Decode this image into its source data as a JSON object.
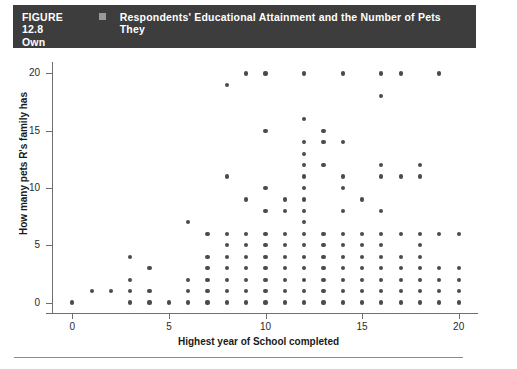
{
  "caption": {
    "figure_number": "FIGURE 12.8",
    "marker_icon": "filled-square-icon",
    "title_line1": "Respondents' Educational Attainment and the Number of Pets They",
    "title_line2": "Own",
    "bar_color": "#3d3d3d",
    "text_color": "#ffffff"
  },
  "chart_data": {
    "type": "scatter",
    "title": "Respondents' Educational Attainment and the Number of Pets They Own",
    "xlabel": "Highest year of School completed",
    "ylabel": "How many pets R's family has",
    "xlim": [
      -1,
      21
    ],
    "ylim": [
      -1,
      21
    ],
    "xticks": [
      0,
      5,
      10,
      15,
      20
    ],
    "yticks": [
      0,
      5,
      10,
      15,
      20
    ],
    "xtick_labels": [
      "0",
      "5",
      "10",
      "15",
      "20"
    ],
    "ytick_labels": [
      "0",
      "5",
      "10",
      "15",
      "20"
    ],
    "grid": false,
    "legend": false,
    "marker_color": "#4a4a52",
    "marker_size": 4,
    "points": [
      [
        0,
        0
      ],
      [
        1,
        1
      ],
      [
        2,
        1
      ],
      [
        3,
        0
      ],
      [
        3,
        1
      ],
      [
        3,
        2
      ],
      [
        3,
        4
      ],
      [
        4,
        0
      ],
      [
        4,
        1
      ],
      [
        4,
        3
      ],
      [
        5,
        0
      ],
      [
        6,
        0
      ],
      [
        6,
        1
      ],
      [
        6,
        2
      ],
      [
        6,
        7
      ],
      [
        7,
        0
      ],
      [
        7,
        1
      ],
      [
        7,
        2
      ],
      [
        7,
        3
      ],
      [
        7,
        4
      ],
      [
        7,
        6
      ],
      [
        8,
        0
      ],
      [
        8,
        1
      ],
      [
        8,
        2
      ],
      [
        8,
        3
      ],
      [
        8,
        4
      ],
      [
        8,
        5
      ],
      [
        8,
        6
      ],
      [
        8,
        11
      ],
      [
        8,
        19
      ],
      [
        9,
        0
      ],
      [
        9,
        1
      ],
      [
        9,
        2
      ],
      [
        9,
        3
      ],
      [
        9,
        4
      ],
      [
        9,
        5
      ],
      [
        9,
        6
      ],
      [
        9,
        9
      ],
      [
        9,
        20
      ],
      [
        10,
        0
      ],
      [
        10,
        1
      ],
      [
        10,
        2
      ],
      [
        10,
        3
      ],
      [
        10,
        4
      ],
      [
        10,
        5
      ],
      [
        10,
        6
      ],
      [
        10,
        8
      ],
      [
        10,
        10
      ],
      [
        10,
        15
      ],
      [
        10,
        20
      ],
      [
        11,
        0
      ],
      [
        11,
        1
      ],
      [
        11,
        2
      ],
      [
        11,
        3
      ],
      [
        11,
        4
      ],
      [
        11,
        5
      ],
      [
        11,
        6
      ],
      [
        11,
        8
      ],
      [
        11,
        9
      ],
      [
        12,
        0
      ],
      [
        12,
        1
      ],
      [
        12,
        2
      ],
      [
        12,
        3
      ],
      [
        12,
        4
      ],
      [
        12,
        5
      ],
      [
        12,
        6
      ],
      [
        12,
        7
      ],
      [
        12,
        8
      ],
      [
        12,
        9
      ],
      [
        12,
        10
      ],
      [
        12,
        11
      ],
      [
        12,
        12
      ],
      [
        12,
        13
      ],
      [
        12,
        14
      ],
      [
        12,
        16
      ],
      [
        12,
        20
      ],
      [
        13,
        0
      ],
      [
        13,
        1
      ],
      [
        13,
        2
      ],
      [
        13,
        3
      ],
      [
        13,
        4
      ],
      [
        13,
        5
      ],
      [
        13,
        6
      ],
      [
        13,
        12
      ],
      [
        13,
        14
      ],
      [
        13,
        15
      ],
      [
        14,
        0
      ],
      [
        14,
        1
      ],
      [
        14,
        2
      ],
      [
        14,
        3
      ],
      [
        14,
        4
      ],
      [
        14,
        5
      ],
      [
        14,
        6
      ],
      [
        14,
        8
      ],
      [
        14,
        10
      ],
      [
        14,
        11
      ],
      [
        14,
        14
      ],
      [
        14,
        20
      ],
      [
        15,
        0
      ],
      [
        15,
        1
      ],
      [
        15,
        2
      ],
      [
        15,
        3
      ],
      [
        15,
        4
      ],
      [
        15,
        5
      ],
      [
        15,
        6
      ],
      [
        15,
        9
      ],
      [
        16,
        0
      ],
      [
        16,
        1
      ],
      [
        16,
        2
      ],
      [
        16,
        3
      ],
      [
        16,
        4
      ],
      [
        16,
        5
      ],
      [
        16,
        6
      ],
      [
        16,
        8
      ],
      [
        16,
        11
      ],
      [
        16,
        12
      ],
      [
        16,
        18
      ],
      [
        16,
        20
      ],
      [
        17,
        0
      ],
      [
        17,
        1
      ],
      [
        17,
        2
      ],
      [
        17,
        3
      ],
      [
        17,
        4
      ],
      [
        17,
        6
      ],
      [
        17,
        11
      ],
      [
        17,
        20
      ],
      [
        18,
        0
      ],
      [
        18,
        1
      ],
      [
        18,
        2
      ],
      [
        18,
        3
      ],
      [
        18,
        4
      ],
      [
        18,
        5
      ],
      [
        18,
        6
      ],
      [
        18,
        11
      ],
      [
        18,
        12
      ],
      [
        19,
        0
      ],
      [
        19,
        1
      ],
      [
        19,
        2
      ],
      [
        19,
        3
      ],
      [
        19,
        6
      ],
      [
        19,
        20
      ],
      [
        20,
        0
      ],
      [
        20,
        1
      ],
      [
        20,
        2
      ],
      [
        20,
        3
      ],
      [
        20,
        6
      ]
    ]
  }
}
